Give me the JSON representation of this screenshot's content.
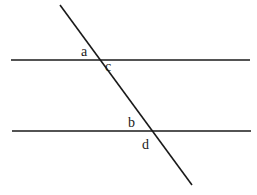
{
  "diagram": {
    "title": "",
    "line_color": "#1a1a1a",
    "lines": [
      {
        "id": "upper-parallel",
        "x1": 11,
        "y1": 60,
        "x2": 250,
        "y2": 60
      },
      {
        "id": "lower-parallel",
        "x1": 12,
        "y1": 131,
        "x2": 251,
        "y2": 131
      },
      {
        "id": "transversal",
        "x1": 60,
        "y1": 5,
        "x2": 192,
        "y2": 185
      }
    ],
    "labels": [
      {
        "id": "a",
        "text": "a",
        "x": 81,
        "y": 56
      },
      {
        "id": "c",
        "text": "c",
        "x": 105,
        "y": 71
      },
      {
        "id": "b",
        "text": "b",
        "x": 128,
        "y": 127
      },
      {
        "id": "d",
        "text": "d",
        "x": 142,
        "y": 149
      }
    ]
  }
}
